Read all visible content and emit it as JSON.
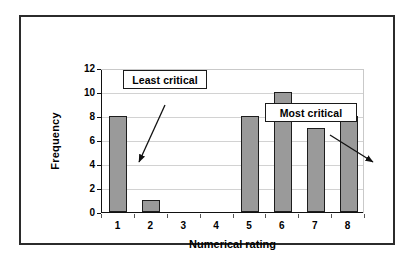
{
  "chart_data": {
    "type": "bar",
    "title": "",
    "xlabel": "Numerical rating",
    "ylabel": "Frequency",
    "categories": [
      "1",
      "2",
      "3",
      "4",
      "5",
      "6",
      "7",
      "8"
    ],
    "values": [
      8,
      1,
      0,
      0,
      8,
      10,
      7,
      8
    ],
    "ylim": [
      0,
      12
    ],
    "yticks": [
      "0",
      "2",
      "4",
      "6",
      "8",
      "10",
      "12"
    ],
    "ytick_values": [
      0,
      2,
      4,
      6,
      8,
      10,
      12
    ],
    "grid": "horizontal",
    "legend": "none",
    "bar_color": "#9a9a9a",
    "bar_border_color": "#1d1d1d",
    "gridline_color": "#d2d2d2",
    "axis_color": "#111111",
    "annotations": [
      {
        "id": "least-critical",
        "text": "Least critical",
        "points_to_category": "2",
        "points_to_value": 4
      },
      {
        "id": "most-critical",
        "text": "Most critical",
        "points_to_category": "8",
        "points_to_value": 4
      }
    ]
  },
  "figure": {
    "border_color": "#2b2b2b",
    "background": "#ffffff"
  }
}
